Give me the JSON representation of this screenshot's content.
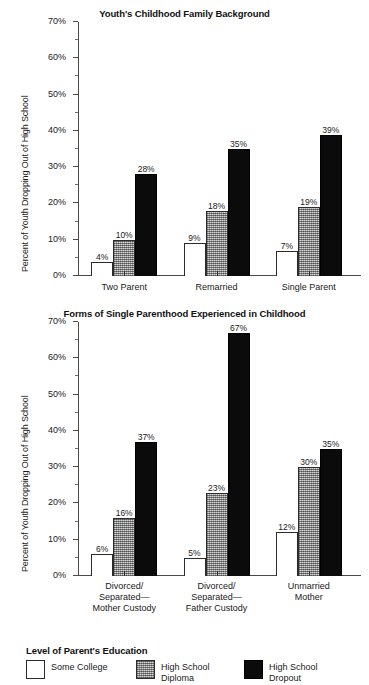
{
  "figure": {
    "shared_ylabel": "Percent of Youth Dropping Out of High School",
    "legend": {
      "title": "Level of Parent's Education",
      "entries": [
        {
          "label": "Some College",
          "color": "#ffffff",
          "key": "some-college"
        },
        {
          "label": "High School\nDiploma",
          "color": "#a2a2a2",
          "key": "hs-diploma"
        },
        {
          "label": "High School\nDropout",
          "color": "#0b0b0b",
          "key": "hs-dropout"
        }
      ]
    }
  },
  "chart_data": [
    {
      "id": "chart-top",
      "type": "bar",
      "title": "Youth's Childhood Family Background",
      "xlabel": "",
      "ylabel": "Percent of Youth Dropping Out of High School",
      "ylim": [
        0,
        70
      ],
      "ytick_labels": [
        "0%",
        "10%",
        "20%",
        "30%",
        "40%",
        "50%",
        "60%",
        "70%"
      ],
      "ytick_values": [
        0,
        10,
        20,
        30,
        40,
        50,
        60,
        70
      ],
      "yminor_values": [
        5,
        15,
        25,
        35,
        45,
        55,
        65
      ],
      "grid": false,
      "legend_position": "bottom-shared",
      "categories": [
        "Two Parent",
        "Remarried",
        "Single Parent"
      ],
      "series": [
        {
          "name": "Some College",
          "values": [
            4,
            9,
            7
          ],
          "labels": [
            "4%",
            "9%",
            "7%"
          ]
        },
        {
          "name": "High School Diploma",
          "values": [
            10,
            18,
            19
          ],
          "labels": [
            "10%",
            "18%",
            "19%"
          ]
        },
        {
          "name": "High School Dropout",
          "values": [
            28,
            35,
            39
          ],
          "labels": [
            "28%",
            "35%",
            "39%"
          ]
        }
      ]
    },
    {
      "id": "chart-bottom",
      "type": "bar",
      "title": "Forms of Single Parenthood Experienced in Childhood",
      "xlabel": "",
      "ylabel": "Percent of Youth Dropping Out of High School",
      "ylim": [
        0,
        70
      ],
      "ytick_labels": [
        "0%",
        "10%",
        "20%",
        "30%",
        "40%",
        "50%",
        "60%",
        "70%"
      ],
      "ytick_values": [
        0,
        10,
        20,
        30,
        40,
        50,
        60,
        70
      ],
      "yminor_values": [
        5,
        15,
        25,
        35,
        45,
        55,
        65
      ],
      "grid": false,
      "legend_position": "bottom-shared",
      "categories": [
        "Divorced/\nSeparated—\nMother Custody",
        "Divorced/\nSeparated—\nFather Custody",
        "Unmarried\nMother"
      ],
      "series": [
        {
          "name": "Some College",
          "values": [
            6,
            5,
            12
          ],
          "labels": [
            "6%",
            "5%",
            "12%"
          ]
        },
        {
          "name": "High School Diploma",
          "values": [
            16,
            23,
            30
          ],
          "labels": [
            "16%",
            "23%",
            "30%"
          ]
        },
        {
          "name": "High School Dropout",
          "values": [
            37,
            67,
            35
          ],
          "labels": [
            "37%",
            "67%",
            "35%"
          ]
        }
      ]
    }
  ]
}
